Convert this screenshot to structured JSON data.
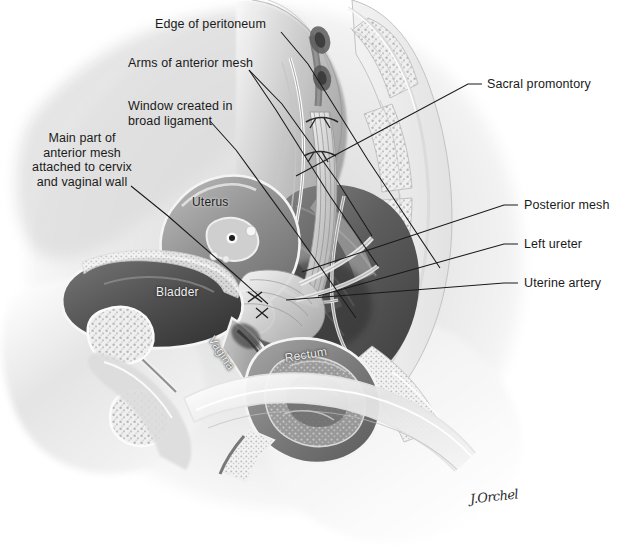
{
  "figure": {
    "background_color": "#ffffff",
    "ink_color": "#1a1a1a",
    "width": 634,
    "height": 547
  },
  "callouts": {
    "left": [
      {
        "id": "edge-of-peritoneum",
        "text": "Edge of peritoneum"
      },
      {
        "id": "arms-of-anterior-mesh",
        "text": "Arms of anterior mesh"
      },
      {
        "id": "window-broad-ligament",
        "text": "Window created in\nbroad ligament"
      },
      {
        "id": "main-part-anterior-mesh",
        "text": "Main part of\nanterior mesh\nattached to cervix\nand vaginal wall"
      }
    ],
    "right": [
      {
        "id": "sacral-promontory",
        "text": "Sacral promontory"
      },
      {
        "id": "posterior-mesh",
        "text": "Posterior mesh"
      },
      {
        "id": "left-ureter",
        "text": "Left ureter"
      },
      {
        "id": "uterine-artery",
        "text": "Uterine artery"
      }
    ]
  },
  "organ_labels": [
    {
      "id": "uterus",
      "text": "Uterus",
      "tone": "dark"
    },
    {
      "id": "bladder",
      "text": "Bladder",
      "tone": "light"
    },
    {
      "id": "vagina",
      "text": "Vagina",
      "tone": "light"
    },
    {
      "id": "rectum",
      "text": "Rectum",
      "tone": "light"
    }
  ],
  "signature": {
    "text": "J.Orchel"
  },
  "palette": {
    "paper": "#ffffff",
    "line": "#1a1a1a",
    "tissue_light": "#e6e6e6",
    "tissue_mid": "#b4b4b4",
    "tissue_dark": "#6e6e6e",
    "cavity": "#4a4a4a",
    "bone": "#f0f0f0",
    "highlight": "#ffffff"
  }
}
